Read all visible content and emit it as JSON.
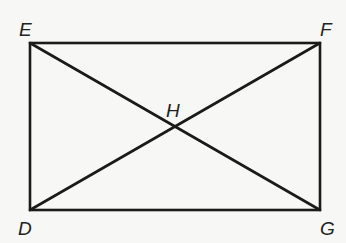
{
  "diagram": {
    "type": "rectangle-with-diagonals",
    "points": {
      "E": {
        "label": "E",
        "x": 30,
        "y": 43
      },
      "F": {
        "label": "F",
        "x": 320,
        "y": 43
      },
      "G": {
        "label": "G",
        "x": 320,
        "y": 210
      },
      "D": {
        "label": "D",
        "x": 30,
        "y": 210
      },
      "H": {
        "label": "H",
        "x": 174,
        "y": 128
      }
    },
    "segments": [
      "EF",
      "FG",
      "GD",
      "DE",
      "EG",
      "DF"
    ],
    "intersection": "H",
    "colors": {
      "line": "#1a1a1a",
      "background": "#f7f7f5"
    }
  }
}
